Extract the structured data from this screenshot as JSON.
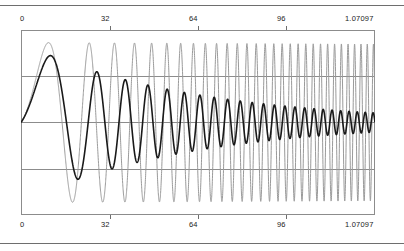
{
  "figure": {
    "title": "",
    "background_color": "#ffffff",
    "frame_color": "#8c8c8c",
    "rule_color": "#6e6e6e"
  },
  "axis": {
    "top_ticks": [
      "0",
      "32",
      "64",
      "96",
      "1.07097"
    ],
    "bottom_ticks": [
      "0",
      "32",
      "64",
      "96",
      "1.07097"
    ]
  },
  "chart_data": {
    "type": "line",
    "title": "",
    "xlabel": "",
    "ylabel": "",
    "xlim": [
      0,
      1.07097
    ],
    "ylim": [
      -1.1,
      1.1
    ],
    "grid": true,
    "grid_orientation": "horizontal",
    "gridline_values": [
      0.5,
      0.0,
      -0.5
    ],
    "legend": "none",
    "xticks": [
      0,
      32,
      64,
      96,
      1.07097
    ],
    "xticklabels": [
      "0",
      "32",
      "64",
      "96",
      "1.07097"
    ],
    "xticks_top": true,
    "xticks_bottom": true,
    "series": [
      {
        "name": "damped-chirp",
        "color": "#1a1a1a",
        "linewidth": 1.6,
        "description": "Damped oscillation: amplitude decays toward a small steady ripple while frequency increases left to right",
        "envelope_start": 1.0,
        "envelope_end": 0.12,
        "frequency_start_cycles": 1,
        "frequency_end_cycles": 46
      },
      {
        "name": "aliased-carrier",
        "color": "#9a9a9a",
        "linewidth": 1.0,
        "description": "High-frequency curve retaining near-full amplitude across the whole axis, overlapping the black curve near x=0",
        "envelope_start": 1.0,
        "envelope_end": 0.98,
        "frequency_start_cycles": 1,
        "frequency_end_cycles": 58
      }
    ]
  }
}
